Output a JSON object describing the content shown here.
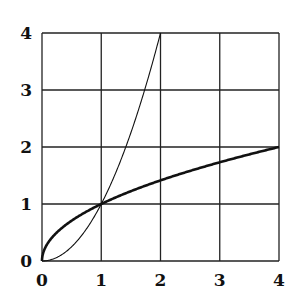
{
  "chart_data": {
    "type": "line",
    "title": "",
    "xlabel": "",
    "ylabel": "",
    "xlim": [
      0,
      4
    ],
    "ylim": [
      0,
      4
    ],
    "grid": true,
    "x_ticks": [
      "0",
      "1",
      "2",
      "3",
      "4"
    ],
    "y_ticks": [
      "0",
      "1",
      "2",
      "3",
      "4"
    ],
    "series": [
      {
        "name": "y = x^2",
        "style": "thin",
        "x": [
          0,
          0.5,
          1,
          1.5,
          2
        ],
        "y": [
          0,
          0.25,
          1,
          2.25,
          4
        ]
      },
      {
        "name": "y = sqrt(x)",
        "style": "thick",
        "x": [
          0,
          0.25,
          0.5,
          1,
          2,
          3,
          4
        ],
        "y": [
          0,
          0.5,
          0.707,
          1,
          1.414,
          1.732,
          2
        ]
      }
    ]
  }
}
